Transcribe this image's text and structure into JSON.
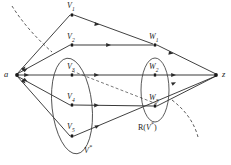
{
  "figure": {
    "type": "network-flow-graph",
    "background_color": "#ffffff",
    "line_color": "#2b2b2b",
    "label_color": "#1a1a1a"
  },
  "terminals": {
    "source": {
      "label": "a",
      "x": 14,
      "y": 75
    },
    "sink": {
      "label": "z",
      "x": 219,
      "y": 75
    }
  },
  "nodes": [
    {
      "id": "v1",
      "label": "V",
      "subscript": "1",
      "x": 72,
      "y": 14,
      "label_x": 68,
      "label_y": 2
    },
    {
      "id": "v2",
      "label": "V",
      "subscript": "2",
      "x": 72,
      "y": 45,
      "label_x": 68,
      "label_y": 33
    },
    {
      "id": "v3",
      "label": "V",
      "subscript": "3",
      "x": 72,
      "y": 75,
      "label_x": 68,
      "label_y": 63
    },
    {
      "id": "v4",
      "label": "V",
      "subscript": "4",
      "x": 72,
      "y": 105,
      "label_x": 68,
      "label_y": 93
    },
    {
      "id": "v5",
      "label": "V",
      "subscript": "5",
      "x": 72,
      "y": 136,
      "label_x": 68,
      "label_y": 122
    },
    {
      "id": "w1",
      "label": "W",
      "subscript": "1",
      "x": 155,
      "y": 45,
      "label_x": 150,
      "label_y": 33
    },
    {
      "id": "w2",
      "label": "W",
      "subscript": "2",
      "x": 155,
      "y": 75,
      "label_x": 150,
      "label_y": 63
    },
    {
      "id": "w3",
      "label": "W",
      "subscript": "3",
      "x": 155,
      "y": 106,
      "label_x": 150,
      "label_y": 94
    }
  ],
  "edges": [
    {
      "from": "a",
      "to": "v1"
    },
    {
      "from": "a",
      "to": "v2"
    },
    {
      "from": "a",
      "to": "v3"
    },
    {
      "from": "a",
      "to": "v4"
    },
    {
      "from": "a",
      "to": "v5"
    },
    {
      "from": "v1",
      "to": "w1"
    },
    {
      "from": "v2",
      "to": "w1"
    },
    {
      "from": "v3",
      "to": "w2"
    },
    {
      "from": "v4",
      "to": "w3"
    },
    {
      "from": "v5",
      "to": "z"
    },
    {
      "from": "w1",
      "to": "z"
    },
    {
      "from": "w2",
      "to": "z"
    },
    {
      "from": "w3",
      "to": "z"
    }
  ],
  "dashed_edges": [
    {
      "from": "v3",
      "to": "w3",
      "style": "dashed"
    }
  ],
  "groups": [
    {
      "id": "v-star",
      "label": "V",
      "superscript": "*",
      "shape": "ellipse",
      "cx": 72,
      "cy": 106,
      "rx": 20,
      "ry": 48,
      "rotation": -6,
      "label_x": 84,
      "label_y": 145
    },
    {
      "id": "r-v-star",
      "label_prefix": "R(",
      "label_var": "V",
      "label_superscript": "*",
      "label_suffix": ")",
      "shape": "ellipse",
      "cx": 155,
      "cy": 90,
      "rx": 14,
      "ry": 32,
      "rotation": 0,
      "label_x": 140,
      "label_y": 122
    }
  ],
  "cut_curves": [
    {
      "id": "cut-upper-left",
      "description": "dashed cut arc entering from top-left"
    },
    {
      "id": "cut-lower-right",
      "description": "dashed cut arc exiting to bottom-right"
    }
  ]
}
